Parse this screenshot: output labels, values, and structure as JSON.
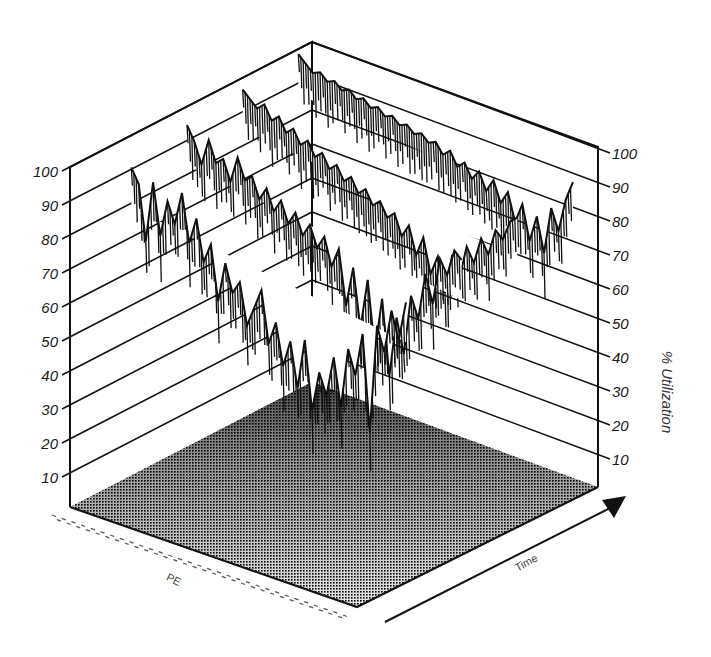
{
  "chart_data": {
    "type": "surface3d",
    "title": "",
    "zlabel": "% Utilization",
    "xlabel": "PE",
    "ylabel": "Time",
    "zlim": [
      0,
      100
    ],
    "z_ticks": [
      10,
      20,
      30,
      40,
      50,
      60,
      70,
      80,
      90,
      100
    ],
    "grid": true,
    "rows": [
      {
        "pe": "front",
        "values": [
          92,
          88,
          72,
          90,
          75,
          86,
          80,
          90,
          76,
          84,
          72,
          78,
          62,
          74,
          66,
          70,
          58,
          64,
          70,
          55,
          62,
          50,
          58,
          45,
          60,
          40,
          52,
          46,
          58,
          44,
          62,
          55,
          68,
          40,
          72,
          65,
          78,
          70,
          82
        ]
      },
      {
        "pe": "mid-front",
        "values": [
          96,
          92,
          86,
          94,
          88,
          90,
          84,
          92,
          86,
          88,
          82,
          86,
          80,
          84,
          78,
          82,
          76,
          80,
          74,
          78,
          70,
          76,
          60,
          72,
          55,
          70,
          50,
          66,
          44,
          62,
          52,
          70,
          64,
          78,
          70,
          84,
          80,
          88,
          86
        ]
      },
      {
        "pe": "middle",
        "values": [
          98,
          96,
          94,
          96,
          92,
          94,
          90,
          92,
          88,
          90,
          86,
          88,
          84,
          86,
          82,
          84,
          80,
          82,
          78,
          80,
          76,
          78,
          72,
          76,
          68,
          74,
          64,
          70,
          60,
          72,
          66,
          76,
          72,
          80,
          76,
          84,
          82,
          88,
          90
        ]
      },
      {
        "pe": "back",
        "values": [
          100,
          98,
          96,
          97,
          95,
          96,
          94,
          95,
          93,
          94,
          92,
          93,
          91,
          92,
          90,
          91,
          89,
          90,
          88,
          89,
          86,
          88,
          84,
          86,
          82,
          85,
          80,
          84,
          78,
          82,
          74,
          80,
          70,
          78,
          68,
          82,
          76,
          86,
          92
        ]
      }
    ]
  },
  "axes": {
    "left_ticks": [
      "100",
      "90",
      "80",
      "70",
      "60",
      "50",
      "40",
      "30",
      "20",
      "10"
    ],
    "right_ticks": [
      "100",
      "90",
      "80",
      "70",
      "60",
      "50",
      "40",
      "30",
      "20",
      "10"
    ],
    "z_title": "% Utilization",
    "pe_title": "PE",
    "time_title": "Time"
  },
  "colors": {
    "line": "#111111",
    "floor_dark": "#1c1c1c",
    "floor_light": "#e6e6e6",
    "background": "#ffffff"
  }
}
